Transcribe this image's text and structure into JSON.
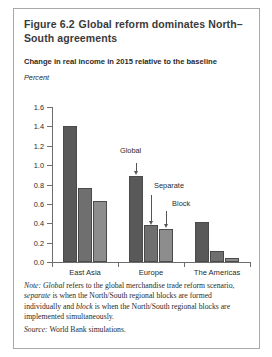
{
  "figure": {
    "number": "Figure 6.2",
    "title": "Global reform dominates North–South agreements",
    "subtitle": "Change in real income in 2015 relative to the baseline"
  },
  "note": {
    "label": "Note:",
    "term_global": "Global",
    "text_1": " refers to the global merchandise trade reform scenario, ",
    "term_separate": "separate",
    "text_2": " is when the North/South regional blocks are formed individually and ",
    "term_block": "block",
    "text_3": " is when the North/South regional blocks are implemented simultaneously."
  },
  "source": {
    "label": "Source:",
    "text": " World Bank simulations."
  },
  "annotations": {
    "global": "Global",
    "separate": "Separate",
    "block": "Block"
  },
  "colors": {
    "series_global": "#595959",
    "series_separate": "#6f6f6f",
    "series_block": "#8d8d8d",
    "axis": "#6d6d6d",
    "frame": "#a8a8a8",
    "title": "#3a3a3a"
  },
  "chart_data": {
    "type": "bar",
    "subtitle": "Change in real income in 2015 relative to the baseline",
    "xlabel": "",
    "ylabel": "Percent",
    "ylim": [
      0.0,
      1.6
    ],
    "yticks": [
      0.0,
      0.2,
      0.4,
      0.6,
      0.8,
      1.0,
      1.2,
      1.4,
      1.6
    ],
    "ytick_labels": [
      "0.0",
      "0.2",
      "0.4",
      "0.6",
      "0.8",
      "1.0",
      "1.2",
      "1.4",
      "1.6"
    ],
    "grid": false,
    "legend": "none (arrow annotations instead)",
    "categories": [
      "East Asia",
      "Europe",
      "The Americas"
    ],
    "series": [
      {
        "name": "Global",
        "values": [
          1.4,
          0.89,
          0.41
        ]
      },
      {
        "name": "Separate",
        "values": [
          0.76,
          0.38,
          0.11
        ]
      },
      {
        "name": "Block",
        "values": [
          0.63,
          0.345,
          0.04
        ]
      }
    ]
  }
}
